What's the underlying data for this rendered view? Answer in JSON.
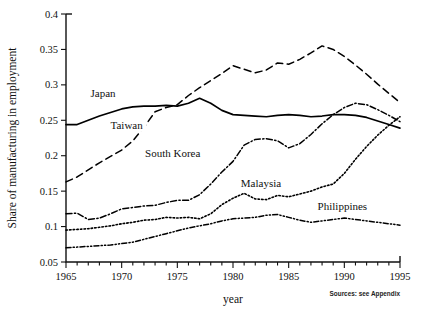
{
  "chart_data": {
    "type": "line",
    "title": "",
    "xlabel": "year",
    "ylabel": "Share of manufacturing in employment",
    "xlim": [
      1965,
      1995
    ],
    "ylim": [
      0.05,
      0.4
    ],
    "grid": false,
    "legend_position": "inline-labels",
    "source_note": "Sources: see Appendix",
    "x_ticks": [
      1965,
      1970,
      1975,
      1980,
      1985,
      1990,
      1995
    ],
    "x_tick_labels": [
      "1965",
      "1970",
      "1975",
      "1980",
      "1985",
      "1990",
      "1995"
    ],
    "x_minor_ticks_every": 1,
    "y_ticks": [
      0.05,
      0.1,
      0.15,
      0.2,
      0.25,
      0.3,
      0.35,
      0.4
    ],
    "y_tick_labels": [
      "0.05",
      "0.1",
      "0.15",
      "0.2",
      "0.25",
      "0.3",
      "0.35",
      "0.4"
    ],
    "x": [
      1965,
      1966,
      1967,
      1968,
      1969,
      1970,
      1971,
      1972,
      1973,
      1974,
      1975,
      1976,
      1977,
      1978,
      1979,
      1980,
      1981,
      1982,
      1983,
      1984,
      1985,
      1986,
      1987,
      1988,
      1989,
      1990,
      1991,
      1992,
      1993,
      1994,
      1995
    ],
    "series": [
      {
        "name": "Japan",
        "style": "solid",
        "label_x": 1967.2,
        "label_y": 0.283,
        "values": [
          0.244,
          0.244,
          0.25,
          0.256,
          0.261,
          0.266,
          0.269,
          0.27,
          0.27,
          0.271,
          0.27,
          0.274,
          0.281,
          0.274,
          0.264,
          0.258,
          0.257,
          0.256,
          0.255,
          0.257,
          0.258,
          0.257,
          0.255,
          0.256,
          0.258,
          0.258,
          0.257,
          0.254,
          0.249,
          0.244,
          0.239
        ]
      },
      {
        "name": "Taiwan",
        "style": "dashed",
        "label_x": 1969.0,
        "label_y": 0.238,
        "values": [
          0.163,
          0.17,
          0.18,
          0.19,
          0.199,
          0.208,
          0.221,
          0.24,
          0.262,
          0.268,
          0.272,
          0.285,
          0.296,
          0.306,
          0.316,
          0.327,
          0.322,
          0.317,
          0.321,
          0.331,
          0.329,
          0.336,
          0.345,
          0.355,
          0.35,
          0.34,
          0.328,
          0.315,
          0.301,
          0.288,
          0.275
        ]
      },
      {
        "name": "South Korea",
        "style": "dash-dot",
        "label_x": 1972.1,
        "label_y": 0.198,
        "values": [
          0.118,
          0.119,
          0.11,
          0.112,
          0.118,
          0.125,
          0.127,
          0.129,
          0.13,
          0.134,
          0.137,
          0.137,
          0.145,
          0.16,
          0.177,
          0.192,
          0.215,
          0.223,
          0.224,
          0.221,
          0.211,
          0.217,
          0.23,
          0.245,
          0.258,
          0.268,
          0.274,
          0.272,
          0.265,
          0.257,
          0.248
        ]
      },
      {
        "name": "Malaysia",
        "style": "dotted",
        "label_x": 1980.7,
        "label_y": 0.156,
        "values": [
          0.095,
          0.096,
          0.097,
          0.099,
          0.101,
          0.104,
          0.106,
          0.109,
          0.11,
          0.113,
          0.112,
          0.113,
          0.111,
          0.118,
          0.131,
          0.14,
          0.147,
          0.139,
          0.138,
          0.144,
          0.142,
          0.146,
          0.15,
          0.156,
          0.16,
          0.175,
          0.195,
          0.213,
          0.229,
          0.243,
          0.255
        ]
      },
      {
        "name": "Philippines",
        "style": "dash-dot-dot",
        "label_x": 1987.6,
        "label_y": 0.123,
        "values": [
          0.07,
          0.071,
          0.072,
          0.073,
          0.074,
          0.076,
          0.078,
          0.082,
          0.086,
          0.09,
          0.094,
          0.098,
          0.101,
          0.104,
          0.108,
          0.111,
          0.112,
          0.113,
          0.116,
          0.117,
          0.113,
          0.109,
          0.106,
          0.108,
          0.11,
          0.112,
          0.11,
          0.108,
          0.106,
          0.104,
          0.102
        ]
      }
    ]
  }
}
